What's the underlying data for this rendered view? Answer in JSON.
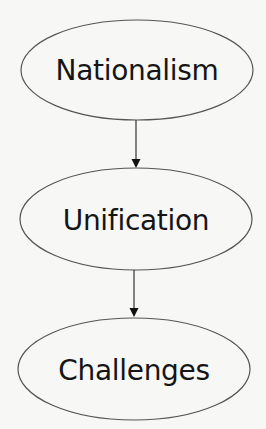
{
  "diagram": {
    "type": "flowchart",
    "direction": "top-to-bottom",
    "colors": {
      "background": "#f7f7f6",
      "node_stroke": "#555555",
      "node_fill": "none",
      "text": "#151515",
      "arrow": "#222222"
    },
    "nodes": [
      {
        "id": "nationalism",
        "label": "Nationalism",
        "shape": "ellipse",
        "cx": 137,
        "cy": 70,
        "rx": 116,
        "ry": 50
      },
      {
        "id": "unification",
        "label": "Unification",
        "shape": "ellipse",
        "cx": 136,
        "cy": 219,
        "rx": 116,
        "ry": 51
      },
      {
        "id": "challenges",
        "label": "Challenges",
        "shape": "ellipse",
        "cx": 134,
        "cy": 369,
        "rx": 116,
        "ry": 51
      }
    ],
    "edges": [
      {
        "from": "nationalism",
        "to": "unification",
        "arrow": "filled-triangle"
      },
      {
        "from": "unification",
        "to": "challenges",
        "arrow": "filled-triangle"
      }
    ]
  }
}
